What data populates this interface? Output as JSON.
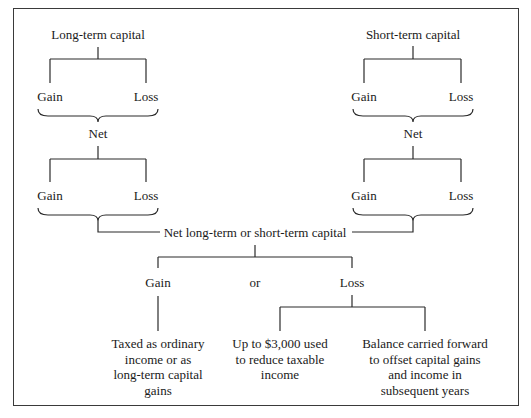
{
  "diagram": {
    "type": "capital-gains-loss-flow",
    "long_term": {
      "title": "Long-term capital",
      "first_split": {
        "left": "Gain",
        "right": "Loss"
      },
      "net_label": "Net",
      "second_split": {
        "left": "Gain",
        "right": "Loss"
      }
    },
    "short_term": {
      "title": "Short-term capital",
      "first_split": {
        "left": "Gain",
        "right": "Loss"
      },
      "net_label": "Net",
      "second_split": {
        "left": "Gain",
        "right": "Loss"
      }
    },
    "combined": {
      "title": "Net long-term or short-term capital",
      "outcomes": {
        "gain": "Gain",
        "separator": "or",
        "loss": "Loss"
      }
    },
    "results": {
      "gain_result": {
        "lines": [
          "Taxed as ordinary",
          "income or as",
          "long-term capital",
          "gains"
        ]
      },
      "loss_result_1": {
        "lines": [
          "Up to $3,000 used",
          "to reduce taxable",
          "income"
        ]
      },
      "loss_result_2": {
        "lines": [
          "Balance carried forward",
          "to offset capital gains",
          "and income in",
          "subsequent years"
        ]
      }
    },
    "colors": {
      "line": "#2a2a2a",
      "text": "#1a1a1a",
      "border": "#3a3a3a",
      "background": "#ffffff"
    }
  }
}
